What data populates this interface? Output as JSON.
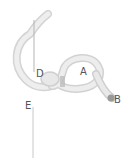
{
  "diagram": {
    "type": "knot-illustration",
    "labels": {
      "a": "A",
      "b": "B",
      "d": "D",
      "e": "E"
    },
    "colors": {
      "rope": "#e4e4e4",
      "rope_edge": "#cfcfcf",
      "rope_shadow": "#bdbdbd",
      "rope_end": "#9a9a9a",
      "pointer_line": "#b5b5b5",
      "label": "#555555"
    }
  }
}
